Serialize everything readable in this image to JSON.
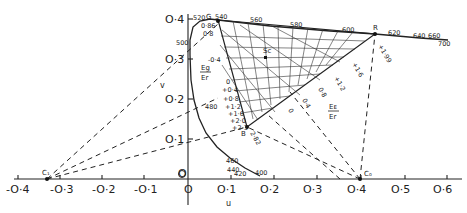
{
  "diagram": {
    "axes": {
      "x_label": "u",
      "y_label": "v",
      "x_ticks": [
        "-O·4",
        "-O·3",
        "-O·2",
        "-O·1",
        "O",
        "O·1",
        "O·2",
        "O·3",
        "O·4",
        "O·5",
        "O·6"
      ],
      "y_ticks": [
        "O·4",
        "O·3",
        "O·2",
        "O·1",
        "O"
      ]
    },
    "spectral_locus_labels": [
      "520",
      "540",
      "560",
      "580",
      "600",
      "620",
      "640",
      "660",
      "700",
      "500",
      "480",
      "460",
      "440",
      "420",
      "400"
    ],
    "points": {
      "G": "G",
      "R": "R",
      "B": "B",
      "Sc": "Sc",
      "C1": "C₁",
      "C0": "C₀"
    },
    "ratio_labels": {
      "eg_er_num": "Eg",
      "eg_er_den": "Er",
      "eb_er_num": "Eᴇ",
      "eb_er_den": "Er"
    },
    "eg_scale": [
      "0·86",
      "0·8",
      "-0·4",
      "0",
      "+0·4",
      "+0·8",
      "+1·2",
      "+1·6",
      "+2·0",
      "+2·3"
    ],
    "r_scale": [
      "+1·99",
      "+1·6",
      "+1·2",
      "0·8",
      "0·4",
      "0"
    ],
    "b_scale": [
      "2·82"
    ]
  }
}
